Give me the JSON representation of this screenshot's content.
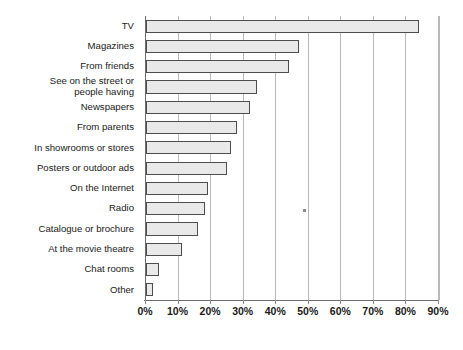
{
  "chart_data": {
    "type": "bar",
    "orientation": "horizontal",
    "title": "",
    "subtitle": "",
    "xlabel": "",
    "ylabel": "",
    "xlim": [
      0,
      90
    ],
    "xtick_labels": [
      "0%",
      "10%",
      "20%",
      "30%",
      "40%",
      "50%",
      "60%",
      "70%",
      "80%",
      "90%"
    ],
    "xtick_values": [
      0,
      10,
      20,
      30,
      40,
      50,
      60,
      70,
      80,
      90
    ],
    "grid": "vertical",
    "legend": "none",
    "unit": "%",
    "categories": [
      "TV",
      "Magazines",
      "From friends",
      "See on the street or\npeople having",
      "Newspapers",
      "From parents",
      "In showrooms or stores",
      "Posters or outdoor ads",
      "On the Internet",
      "Radio",
      "Catalogue or brochure",
      "At the movie theatre",
      "Chat rooms",
      "Other"
    ],
    "values": [
      84,
      47,
      44,
      34,
      32,
      28,
      26,
      25,
      19,
      18,
      16,
      11,
      4,
      2
    ],
    "bar_fill_color": "#e9e9e9",
    "bar_border_color": "#4d4d4d",
    "gridline_color": "#b9b9b9",
    "axis_color": "#6d6d6d",
    "text_color": "#1a1a1a"
  }
}
